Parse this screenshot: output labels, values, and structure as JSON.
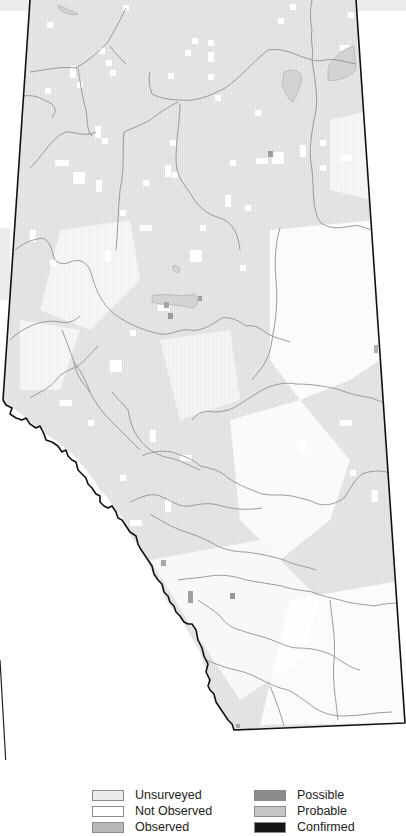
{
  "map": {
    "region": "Alberta",
    "border_color": "#111111",
    "river_color": "#8f8f8f",
    "fill_color": "#e9e9e9",
    "outside_band_color": "#ececec"
  },
  "legend": {
    "items": [
      {
        "label": "Unsurveyed",
        "color": "#eaeaea"
      },
      {
        "label": "Not Observed",
        "color": "#ffffff"
      },
      {
        "label": "Observed",
        "color": "#b9b9b9"
      },
      {
        "label": "Possible",
        "color": "#8b8b8b"
      },
      {
        "label": "Probable",
        "color": "#c6c6c6"
      },
      {
        "label": "Confirmed",
        "color": "#161616"
      }
    ]
  }
}
